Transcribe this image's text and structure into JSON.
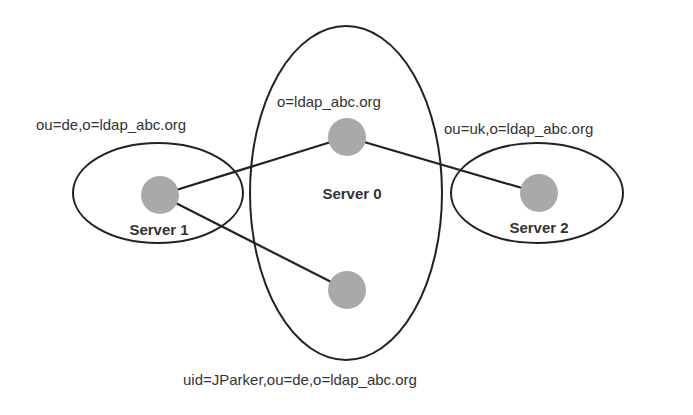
{
  "diagram": {
    "colors": {
      "stroke": "#222222",
      "node_fill": "#a9a9a9",
      "text": "#333333",
      "background": "#ffffff"
    },
    "servers": [
      {
        "id": "server0",
        "label": "Server 0",
        "dn": "o=ldap_abc.org"
      },
      {
        "id": "server1",
        "label": "Server 1",
        "dn": "ou=de,o=ldap_abc.org"
      },
      {
        "id": "server2",
        "label": "Server 2",
        "dn": "ou=uk,o=ldap_abc.org"
      }
    ],
    "entry": {
      "dn": "uid=JParker,ou=de,o=ldap_abc.org"
    },
    "nodes": [
      {
        "id": "root",
        "server": "server0"
      },
      {
        "id": "de",
        "server": "server1"
      },
      {
        "id": "uk",
        "server": "server2"
      },
      {
        "id": "jparker",
        "server": "server0"
      }
    ],
    "edges": [
      {
        "from": "de",
        "to": "root"
      },
      {
        "from": "root",
        "to": "uk"
      },
      {
        "from": "de",
        "to": "jparker"
      }
    ]
  }
}
